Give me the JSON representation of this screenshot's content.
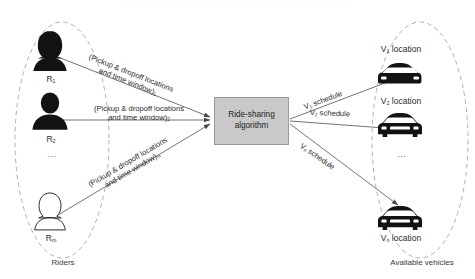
{
  "diagram": {
    "type": "flow-diagram",
    "title_fragment_clipped": "",
    "algorithm": {
      "line1": "Ride-sharing",
      "line2": "algorithm"
    },
    "left_group": {
      "label": "Riders",
      "nodes": [
        {
          "id": "R1",
          "base": "R",
          "sub": "1",
          "icon": "female-rider-icon",
          "fill": "solid"
        },
        {
          "id": "R2",
          "base": "R",
          "sub": "2",
          "icon": "male-rider-icon",
          "fill": "solid"
        },
        {
          "id": "Rm",
          "base": "R",
          "sub": "m",
          "icon": "rider-outline-icon",
          "fill": "outline"
        }
      ],
      "ellipsis": "⋮"
    },
    "right_group": {
      "label": "Available vehicles",
      "nodes": [
        {
          "id": "V1",
          "base": "V",
          "sub": "1",
          "suffix": " location",
          "icon": "sports-car-icon",
          "fill": "solid"
        },
        {
          "id": "V2",
          "base": "V",
          "sub": "2",
          "suffix": " location",
          "icon": "sedan-car-icon",
          "fill": "solid"
        },
        {
          "id": "Vn",
          "base": "V",
          "sub": "n",
          "suffix": " location",
          "icon": "sedan-car-icon",
          "fill": "solid"
        }
      ],
      "ellipsis": "⋮"
    },
    "input_edges": [
      {
        "line1": "(Pickup & dropoff locations",
        "line2": "and time window)",
        "sub": "1"
      },
      {
        "line1": "(Pickup & dropoff locations",
        "line2": "and time window)",
        "sub": "2"
      },
      {
        "line1": "(Pickup & dropoff locations",
        "line2": "and time window)",
        "sub": "m"
      }
    ],
    "output_edges": [
      {
        "base": "V",
        "sub": "1",
        "text": " schedule"
      },
      {
        "base": "V",
        "sub": "2",
        "text": " schedule"
      },
      {
        "base": "V",
        "sub": "n",
        "text": " schedule"
      }
    ]
  },
  "colors": {
    "box_fill": "#c9c9c9",
    "box_border": "#9a9a9a",
    "arrow": "#4a4a4a",
    "dashed_ellipse": "#a7a7a7",
    "icon": "#121212",
    "text": "#2b2b2b"
  }
}
